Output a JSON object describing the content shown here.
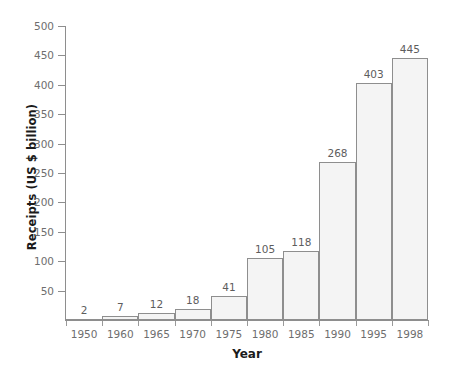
{
  "chart_data": {
    "type": "bar",
    "title": "",
    "xlabel": "Year",
    "ylabel": "Receipts (US $ billion)",
    "categories": [
      "1950",
      "1960",
      "1965",
      "1970",
      "1975",
      "1980",
      "1985",
      "1990",
      "1995",
      "1998"
    ],
    "values": [
      2,
      7,
      12,
      18,
      41,
      105,
      118,
      268,
      403,
      445
    ],
    "value_labels": [
      "2",
      "7",
      "12",
      "18",
      "41",
      "105",
      "118",
      "268",
      "403",
      "445"
    ],
    "ylim": [
      0,
      500
    ],
    "ytick_labels": [
      "50",
      "100",
      "150",
      "200",
      "250",
      "300",
      "350",
      "400",
      "450",
      "500"
    ],
    "ytick_values": [
      50,
      100,
      150,
      200,
      250,
      300,
      350,
      400,
      450,
      500
    ],
    "grid": false,
    "legend": false,
    "legend_position": "none",
    "colors": {
      "bar_fill": "#f4f4f4",
      "bar_border": "#8e8e8e",
      "axis": "#8e8e8e",
      "tick_label": "#6e6e6e",
      "value_label": "#5d5d5d",
      "axis_title": "#1b1b1b",
      "background": "#ffffff"
    }
  }
}
